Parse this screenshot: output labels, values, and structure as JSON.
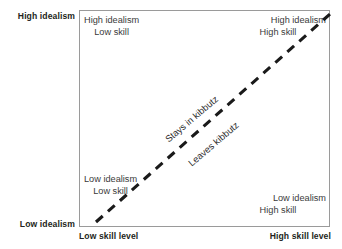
{
  "diagram": {
    "type": "2x2-quadrant-scatter-concept",
    "background_color": "#ffffff",
    "box_border_color": "#9a9a9a",
    "line_color": "#1a1a1a",
    "axes": {
      "y_top_label": "High idealism",
      "y_bottom_label": "Low idealism",
      "x_left_label": "Low skill level",
      "x_right_label": "High skill level"
    },
    "quadrants": [
      {
        "position": "top-left",
        "line_1": "High idealism",
        "line_2": "Low skill"
      },
      {
        "position": "top-right",
        "line_1": "High idealism",
        "line_2": "High skill"
      },
      {
        "position": "bottom-left",
        "line_1": "Low idealism",
        "line_2": "Low skill"
      },
      {
        "position": "bottom-right",
        "line_1": "Low idealism",
        "line_2": "High skill"
      }
    ],
    "divider": {
      "style": "dashed",
      "orientation": "diagonal-rising",
      "label_above": "Stays in kibbutz",
      "label_below": "Leaves kibbutz"
    }
  }
}
